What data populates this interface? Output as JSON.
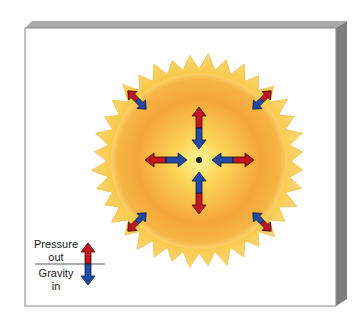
{
  "diagram": {
    "center_marker": "core-point",
    "arrows": {
      "count": 8,
      "pressure_direction": "outward",
      "gravity_direction": "inward"
    },
    "legend": {
      "pressure_label_line1": "Pressure",
      "pressure_label_line2": "out",
      "gravity_label_line1": "Gravity",
      "gravity_label_line2": "in"
    },
    "colors": {
      "pressure": "#c0161e",
      "gravity": "#1f4aa8",
      "sun_core": "#ffe76a",
      "sun_body": "#f4a52e",
      "corona": "#f7c03a",
      "panel_edge": "#8a8a8a"
    }
  }
}
